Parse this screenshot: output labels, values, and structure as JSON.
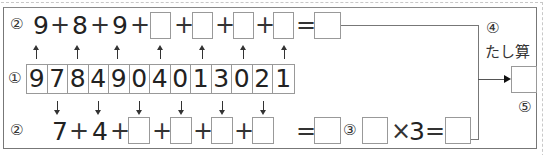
{
  "row_top": {
    "label": "②",
    "terms": [
      "9",
      "8",
      "9"
    ],
    "plus": "+",
    "equals": "=",
    "blank_count": 3
  },
  "row_digits": {
    "label": "①",
    "digits": [
      "9",
      "7",
      "8",
      "4",
      "9",
      "0",
      "4",
      "0",
      "1",
      "3",
      "0",
      "2",
      "1"
    ]
  },
  "row_bottom": {
    "label": "②",
    "terms": [
      "7",
      "4"
    ],
    "plus": "+",
    "equals": "=",
    "blank_count": 4
  },
  "multiply": {
    "label": "③",
    "times": "×",
    "factor": "3",
    "equals": "="
  },
  "sum_section": {
    "step_label": "④",
    "title": "たし算",
    "result_label": "⑤"
  },
  "colors": {
    "text": "#222222",
    "box_border": "#999999",
    "frame_border": "#777777"
  }
}
